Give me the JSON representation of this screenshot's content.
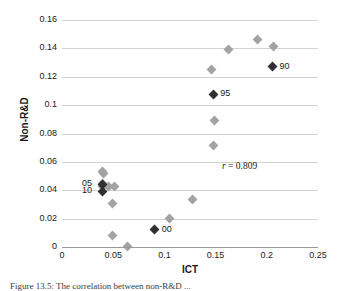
{
  "figure": {
    "caption": "Figure 13.5:  The correlation between non-R&D ..."
  },
  "chart_data": {
    "type": "scatter",
    "title": "",
    "xlabel": "ICT",
    "ylabel": "Non-R&D",
    "xlim": [
      0,
      0.25
    ],
    "ylim": [
      0,
      0.16
    ],
    "xticks": [
      "0",
      "0.05",
      "0.1",
      "0.15",
      "0.2",
      "0.25"
    ],
    "xtick_values": [
      0,
      0.05,
      0.1,
      0.15,
      0.2,
      0.25
    ],
    "yticks": [
      "0",
      "0.02",
      "0.04",
      "0.06",
      "0.08",
      "0.1",
      "0.12",
      "0.14",
      "0.16"
    ],
    "ytick_values": [
      0,
      0.02,
      0.04,
      0.06,
      0.08,
      0.1,
      0.12,
      0.14,
      0.16
    ],
    "grid": "horizontal",
    "legend": "none",
    "annotations": [
      {
        "symbol": "r",
        "text": " = 0.809",
        "x": 0.163,
        "y": 0.0535
      }
    ],
    "marker_colors": {
      "plain": "#a3a3a3",
      "highlight": "#2f2f34"
    },
    "series": [
      {
        "name": "Unlabelled years",
        "color": "#a3a3a3",
        "points": [
          {
            "x": 0.0395,
            "y": 0.0535
          },
          {
            "x": 0.0405,
            "y": 0.0515
          },
          {
            "x": 0.04,
            "y": 0.045
          },
          {
            "x": 0.04,
            "y": 0.0428
          },
          {
            "x": 0.0455,
            "y": 0.0425
          },
          {
            "x": 0.0508,
            "y": 0.0425
          },
          {
            "x": 0.0498,
            "y": 0.031
          },
          {
            "x": 0.049,
            "y": 0.0078
          },
          {
            "x": 0.0635,
            "y": 0.0005
          },
          {
            "x": 0.105,
            "y": 0.02
          },
          {
            "x": 0.1272,
            "y": 0.0332
          },
          {
            "x": 0.148,
            "y": 0.0718
          },
          {
            "x": 0.1485,
            "y": 0.089
          },
          {
            "x": 0.1463,
            "y": 0.1248
          },
          {
            "x": 0.1622,
            "y": 0.1392
          },
          {
            "x": 0.1905,
            "y": 0.1462
          },
          {
            "x": 0.2068,
            "y": 0.1412
          }
        ]
      },
      {
        "name": "Labelled years",
        "color": "#2f2f34",
        "points": [
          {
            "x": 0.2055,
            "y": 0.1272,
            "label": "90"
          },
          {
            "x": 0.1478,
            "y": 0.1078,
            "label": "95"
          },
          {
            "x": 0.0905,
            "y": 0.012,
            "label": "00"
          },
          {
            "x": 0.04,
            "y": 0.0442,
            "label": "05"
          },
          {
            "x": 0.04,
            "y": 0.0392,
            "label": "10"
          }
        ]
      }
    ]
  }
}
